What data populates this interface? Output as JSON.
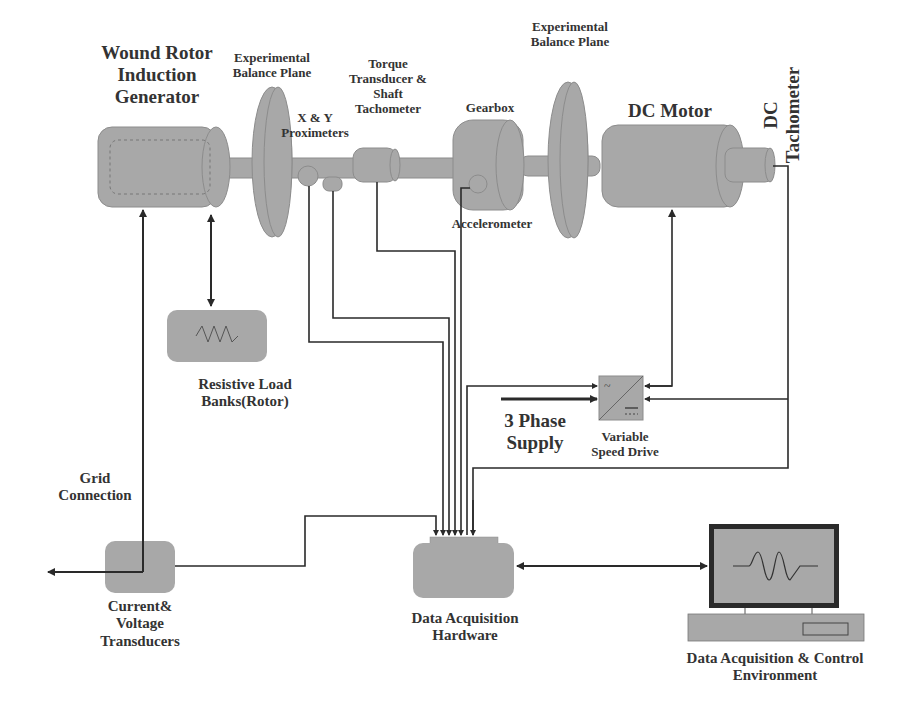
{
  "colors": {
    "component_fill": "#a8a8a8",
    "component_edge": "#8c8c8c",
    "wire": "#2a2a2a",
    "text": "#333333",
    "background": "#ffffff"
  },
  "labels": {
    "generator": [
      "Wound Rotor",
      "Induction",
      "Generator"
    ],
    "balance_plane_1": [
      "Experimental",
      "Balance Plane"
    ],
    "proximeters": [
      "X & Y",
      "Proximeters"
    ],
    "torque_transducer": [
      "Torque",
      "Transducer &",
      "Shaft",
      "Tachometer"
    ],
    "gearbox": "Gearbox",
    "balance_plane_2": [
      "Experimental",
      "Balance Plane"
    ],
    "dc_motor": "DC Motor",
    "dc_tachometer": [
      "DC",
      "Tachometer"
    ],
    "accelerometer": "Accelerometer",
    "resistive_load": [
      "Resistive Load",
      "Banks(Rotor)"
    ],
    "three_phase_supply": [
      "3 Phase",
      "Supply"
    ],
    "variable_speed_drive": [
      "Variable",
      "Speed Drive"
    ],
    "grid_connection": [
      "Grid",
      "Connection"
    ],
    "current_voltage_transducers": [
      "Current&",
      "Voltage",
      "Transducers"
    ],
    "daq_hardware": [
      "Data Acquisition",
      "Hardware"
    ],
    "daq_control_env": [
      "Data Acquisition & Control",
      "Environment"
    ]
  },
  "icons": {
    "resistor": "resistor-zigzag-icon",
    "vsd": "ac-dc-converter-icon",
    "waveform": "sine-wave-icon"
  }
}
